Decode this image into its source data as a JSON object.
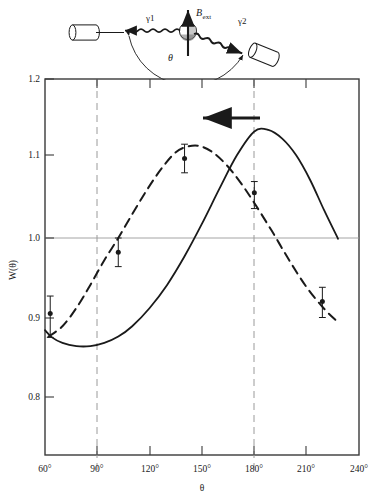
{
  "figure": {
    "caption_present": false,
    "background": "#ffffff",
    "ink": "#1a1a1a",
    "grid_color": "#8a8a8a"
  },
  "inset": {
    "name": "gamma-gamma-angular-correlation-geometry",
    "field_label": "B",
    "field_label_sub": "ext",
    "gamma1_label": "γ1",
    "gamma2_label": "γ2",
    "angle_label": "θ",
    "detector1": "left-detector",
    "detector2": "right-detector",
    "source": "source-nucleus"
  },
  "chart_data": {
    "type": "line",
    "title": "",
    "subtitle": "",
    "xlabel": "θ",
    "ylabel": "W(θ)",
    "xlim": [
      60,
      240
    ],
    "ylim": [
      0.75,
      1.2
    ],
    "xticks": [
      60,
      90,
      120,
      150,
      180,
      210,
      240
    ],
    "xticklabels": [
      "60°",
      "90°",
      "120°",
      "150°",
      "180°",
      "210°",
      "240°"
    ],
    "yticks": [
      0.8,
      0.9,
      1.0,
      1.1,
      1.2
    ],
    "yticklabels": [
      "0.8",
      "0.9",
      "1.0",
      "1.1",
      "1.2"
    ],
    "grid": "horizontal line at W=1.0; vertical dashed lines at 90 and 180",
    "gridlines": {
      "horizontal": [
        1.0
      ],
      "vertical_dashed": [
        90,
        180
      ]
    },
    "legend": null,
    "series": [
      {
        "name": "unperturbed-correlation",
        "style": "solid",
        "points": [
          {
            "x": 60,
            "y": 0.884
          },
          {
            "x": 64,
            "y": 0.875
          },
          {
            "x": 70,
            "y": 0.868
          },
          {
            "x": 78,
            "y": 0.864
          },
          {
            "x": 86,
            "y": 0.864
          },
          {
            "x": 94,
            "y": 0.868
          },
          {
            "x": 102,
            "y": 0.876
          },
          {
            "x": 110,
            "y": 0.889
          },
          {
            "x": 120,
            "y": 0.912
          },
          {
            "x": 130,
            "y": 0.941
          },
          {
            "x": 140,
            "y": 0.977
          },
          {
            "x": 150,
            "y": 1.018
          },
          {
            "x": 160,
            "y": 1.062
          },
          {
            "x": 170,
            "y": 1.104
          },
          {
            "x": 180,
            "y": 1.134
          },
          {
            "x": 188,
            "y": 1.136
          },
          {
            "x": 196,
            "y": 1.125
          },
          {
            "x": 204,
            "y": 1.104
          },
          {
            "x": 212,
            "y": 1.073
          },
          {
            "x": 220,
            "y": 1.035
          },
          {
            "x": 228,
            "y": 0.999
          }
        ]
      },
      {
        "name": "rotated-correlation",
        "style": "dashed",
        "points": [
          {
            "x": 62,
            "y": 0.876
          },
          {
            "x": 70,
            "y": 0.889
          },
          {
            "x": 78,
            "y": 0.912
          },
          {
            "x": 86,
            "y": 0.941
          },
          {
            "x": 94,
            "y": 0.972
          },
          {
            "x": 102,
            "y": 1.0
          },
          {
            "x": 110,
            "y": 1.03
          },
          {
            "x": 118,
            "y": 1.059
          },
          {
            "x": 126,
            "y": 1.085
          },
          {
            "x": 134,
            "y": 1.106
          },
          {
            "x": 140,
            "y": 1.114
          },
          {
            "x": 148,
            "y": 1.116
          },
          {
            "x": 156,
            "y": 1.108
          },
          {
            "x": 164,
            "y": 1.092
          },
          {
            "x": 172,
            "y": 1.07
          },
          {
            "x": 180,
            "y": 1.044
          },
          {
            "x": 190,
            "y": 1.009
          },
          {
            "x": 200,
            "y": 0.972
          },
          {
            "x": 210,
            "y": 0.938
          },
          {
            "x": 220,
            "y": 0.911
          },
          {
            "x": 228,
            "y": 0.894
          }
        ]
      }
    ],
    "data_points": [
      {
        "x": 63,
        "y": 0.905,
        "yerr_up": 0.022,
        "yerr_down": 0.03
      },
      {
        "x": 102,
        "y": 0.982,
        "yerr_up": 0.018,
        "yerr_down": 0.018
      },
      {
        "x": 140,
        "y": 1.1,
        "yerr_up": 0.018,
        "yerr_down": 0.018
      },
      {
        "x": 180,
        "y": 1.057,
        "yerr_up": 0.014,
        "yerr_down": 0.02
      },
      {
        "x": 219,
        "y": 0.92,
        "yerr_up": 0.018,
        "yerr_down": 0.02
      }
    ],
    "annotations": [
      {
        "name": "rotation-arrow",
        "type": "arrow",
        "text": "",
        "x_start": 182,
        "x_end": 146,
        "y": 1.162,
        "direction": "left"
      }
    ]
  }
}
